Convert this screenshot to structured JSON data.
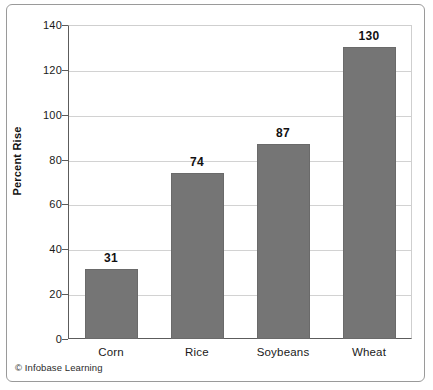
{
  "credit": "© Infobase Learning",
  "chart_data": {
    "type": "bar",
    "title": "",
    "xlabel": "",
    "ylabel": "Percent Rise",
    "categories": [
      "Corn",
      "Rice",
      "Soybeans",
      "Wheat"
    ],
    "values": [
      31,
      74,
      87,
      130
    ],
    "value_labels": [
      "31",
      "74",
      "87",
      "130"
    ],
    "ylim": [
      0,
      140
    ],
    "ytick_step": 20,
    "ytick_labels": [
      "0",
      "20",
      "40",
      "60",
      "80",
      "100",
      "120",
      "140"
    ],
    "grid": true,
    "legend": "none",
    "bar_color": "#757575",
    "grid_color": "#d2d2d2",
    "axis_color": "#5c5c5c",
    "text_color": "#111111",
    "background": "#ffffff"
  }
}
